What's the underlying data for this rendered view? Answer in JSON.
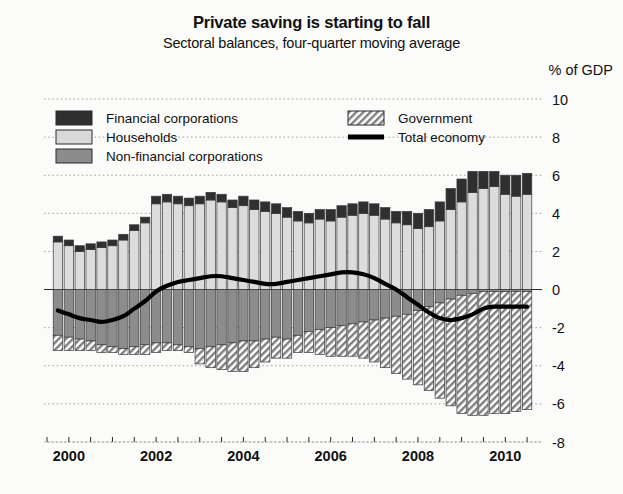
{
  "header": {
    "title": "Private saving is starting to fall",
    "subtitle": "Sectoral balances, four-quarter moving average",
    "unit_label": "% of GDP"
  },
  "legend": [
    {
      "key": "financial",
      "label": "Financial corporations",
      "style": "solid",
      "color": "#2f2f2f"
    },
    {
      "key": "households",
      "label": "Households",
      "style": "solid",
      "color": "#d9d9d9"
    },
    {
      "key": "nonfinancial",
      "label": "Non-financial corporations",
      "style": "solid",
      "color": "#8c8c8c"
    },
    {
      "key": "government",
      "label": "Government",
      "style": "hatch",
      "color": "#9a9a9a"
    },
    {
      "key": "total",
      "label": "Total economy",
      "style": "line",
      "color": "#000000"
    }
  ],
  "chart_data": {
    "type": "bar",
    "subtype": "stacked-bar-with-line",
    "title": "Private saving is starting to fall",
    "subtitle": "Sectoral balances, four-quarter moving average",
    "xlabel": "",
    "ylabel": "% of GDP",
    "ylim": [
      -8,
      10
    ],
    "yticks": [
      -8,
      -6,
      -4,
      -2,
      0,
      2,
      4,
      6,
      8,
      10
    ],
    "ytick_labels": [
      "-8",
      "-6",
      "-4",
      "-2",
      "0",
      "2",
      "4",
      "6",
      "8",
      "10"
    ],
    "grid": true,
    "grid_style": "dotted",
    "legend_position": "top-inside",
    "xlim": [
      1999.5,
      2010.75
    ],
    "xticks_major": [
      2000,
      2002,
      2004,
      2006,
      2008,
      2010
    ],
    "xtick_labels": [
      "2000",
      "2002",
      "2004",
      "2006",
      "2008",
      "2010"
    ],
    "xticks_minor": [
      1999.5,
      2000.5,
      2001,
      2001.5,
      2002.5,
      2003,
      2003.5,
      2004.5,
      2005,
      2005.5,
      2006.5,
      2007,
      2007.5,
      2008.5,
      2009,
      2009.5,
      2010.5
    ],
    "x": [
      1999.75,
      2000.0,
      2000.25,
      2000.5,
      2000.75,
      2001.0,
      2001.25,
      2001.5,
      2001.75,
      2002.0,
      2002.25,
      2002.5,
      2002.75,
      2003.0,
      2003.25,
      2003.5,
      2003.75,
      2004.0,
      2004.25,
      2004.5,
      2004.75,
      2005.0,
      2005.25,
      2005.5,
      2005.75,
      2006.0,
      2006.25,
      2006.5,
      2006.75,
      2007.0,
      2007.25,
      2007.5,
      2007.75,
      2008.0,
      2008.25,
      2008.5,
      2008.75,
      2009.0,
      2009.25,
      2009.5,
      2009.75,
      2010.0,
      2010.25,
      2010.5
    ],
    "series": [
      {
        "name": "Households",
        "key": "households",
        "stack": "positive",
        "values": [
          2.5,
          2.3,
          2.0,
          2.1,
          2.2,
          2.3,
          2.6,
          3.1,
          3.5,
          4.5,
          4.6,
          4.5,
          4.4,
          4.5,
          4.7,
          4.6,
          4.3,
          4.4,
          4.2,
          4.1,
          4.0,
          3.8,
          3.6,
          3.5,
          3.7,
          3.6,
          3.8,
          3.9,
          4.0,
          3.9,
          3.7,
          3.5,
          3.4,
          3.2,
          3.3,
          3.6,
          4.2,
          4.6,
          5.1,
          5.3,
          5.4,
          5.0,
          4.9,
          5.0
        ]
      },
      {
        "name": "Financial corporations",
        "key": "financial",
        "stack": "positive",
        "values": [
          0.3,
          0.3,
          0.3,
          0.3,
          0.3,
          0.3,
          0.3,
          0.3,
          0.3,
          0.4,
          0.4,
          0.4,
          0.4,
          0.4,
          0.4,
          0.4,
          0.4,
          0.5,
          0.5,
          0.5,
          0.5,
          0.5,
          0.5,
          0.5,
          0.5,
          0.6,
          0.6,
          0.6,
          0.6,
          0.6,
          0.6,
          0.6,
          0.7,
          0.8,
          0.9,
          1.0,
          1.1,
          1.2,
          1.1,
          0.9,
          0.8,
          1.0,
          1.1,
          1.1
        ]
      },
      {
        "name": "Non-financial corporations",
        "key": "nonfinancial",
        "stack": "mixed",
        "values": [
          -2.4,
          -2.5,
          -2.6,
          -2.7,
          -2.9,
          -3.0,
          -3.1,
          -3.0,
          -2.9,
          -2.8,
          -2.8,
          -2.9,
          -3.0,
          -3.1,
          -3.0,
          -2.9,
          -2.8,
          -2.7,
          -2.7,
          -2.6,
          -2.5,
          -2.6,
          -2.4,
          -2.2,
          -2.1,
          -2.0,
          -1.9,
          -1.8,
          -1.7,
          -1.6,
          -1.5,
          -1.4,
          -1.3,
          -1.1,
          -0.9,
          -0.7,
          -0.5,
          -0.3,
          -0.2,
          -0.1,
          -0.1,
          -0.1,
          -0.1,
          -0.1
        ]
      },
      {
        "name": "Government",
        "key": "government",
        "stack": "negative",
        "values": [
          -0.8,
          -0.7,
          -0.6,
          -0.5,
          -0.4,
          -0.3,
          -0.3,
          -0.4,
          -0.5,
          -0.5,
          -0.4,
          -0.3,
          -0.3,
          -0.8,
          -1.1,
          -1.3,
          -1.5,
          -1.6,
          -1.4,
          -1.2,
          -1.1,
          -1.0,
          -0.9,
          -1.1,
          -1.3,
          -1.5,
          -1.6,
          -1.7,
          -1.9,
          -2.2,
          -2.6,
          -3.0,
          -3.4,
          -3.9,
          -4.4,
          -5.0,
          -5.6,
          -6.2,
          -6.4,
          -6.5,
          -6.4,
          -6.4,
          -6.3,
          -6.2
        ]
      }
    ],
    "line_series": {
      "name": "Total economy",
      "key": "total",
      "values": [
        -1.1,
        -1.3,
        -1.5,
        -1.6,
        -1.7,
        -1.6,
        -1.4,
        -1.0,
        -0.6,
        -0.1,
        0.2,
        0.4,
        0.5,
        0.6,
        0.7,
        0.7,
        0.6,
        0.5,
        0.4,
        0.3,
        0.3,
        0.4,
        0.5,
        0.6,
        0.7,
        0.8,
        0.9,
        0.9,
        0.8,
        0.6,
        0.3,
        0.0,
        -0.4,
        -0.8,
        -1.2,
        -1.5,
        -1.6,
        -1.5,
        -1.3,
        -1.0,
        -0.9,
        -0.9,
        -0.9,
        -0.9
      ]
    }
  }
}
